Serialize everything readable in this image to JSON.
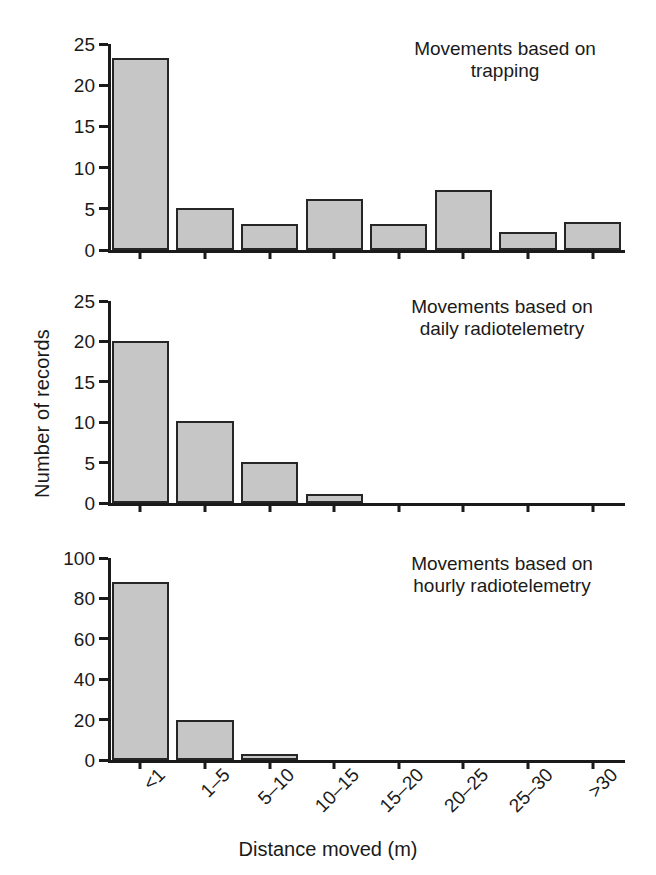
{
  "figure": {
    "xlabel": "Distance moved (m)",
    "ylabel": "Number of records"
  },
  "chart_data": [
    {
      "type": "bar",
      "title": "Movements based on\ntrapping",
      "categories": [
        "<1",
        "1–5",
        "5–10",
        "10–15",
        "15–20",
        "20–25",
        "25–30",
        ">30"
      ],
      "values": [
        23.3,
        5.1,
        3.1,
        6.2,
        3.2,
        7.3,
        2.2,
        3.4
      ],
      "xlabel": "Distance moved (m)",
      "ylabel": "Number of records",
      "ylim": [
        0,
        25
      ],
      "yticks": [
        0,
        5,
        10,
        15,
        20,
        25
      ],
      "ytick_labels": [
        "0",
        "5",
        "10",
        "15",
        "20",
        "25"
      ],
      "grid": false,
      "legend": false,
      "bar_color": "#c6c6c6",
      "bar_edge_color": "#262626"
    },
    {
      "type": "bar",
      "title": "Movements based on\ndaily radiotelemetry",
      "categories": [
        "<1",
        "1–5",
        "5–10",
        "10–15",
        "15–20",
        "20–25",
        "25–30",
        ">30"
      ],
      "values": [
        20.0,
        10.2,
        5.1,
        1.1,
        0,
        0,
        0,
        0
      ],
      "xlabel": "Distance moved (m)",
      "ylabel": "Number of records",
      "ylim": [
        0,
        25
      ],
      "yticks": [
        0,
        5,
        10,
        15,
        20,
        25
      ],
      "ytick_labels": [
        "0",
        "5",
        "10",
        "15",
        "20",
        "25"
      ],
      "grid": false,
      "legend": false,
      "bar_color": "#c6c6c6",
      "bar_edge_color": "#262626"
    },
    {
      "type": "bar",
      "title": "Movements based on\nhourly radiotelemetry",
      "categories": [
        "<1",
        "1–5",
        "5–10",
        "10–15",
        "15–20",
        "20–25",
        "25–30",
        ">30"
      ],
      "values": [
        88,
        20,
        3,
        0,
        0,
        0,
        0,
        0
      ],
      "xlabel": "Distance moved (m)",
      "ylabel": "Number of records",
      "ylim": [
        0,
        100
      ],
      "yticks": [
        0,
        20,
        40,
        60,
        80,
        100
      ],
      "ytick_labels": [
        "0",
        "20",
        "40",
        "60",
        "80",
        "100"
      ],
      "grid": false,
      "legend": false,
      "bar_color": "#c6c6c6",
      "bar_edge_color": "#262626"
    }
  ]
}
